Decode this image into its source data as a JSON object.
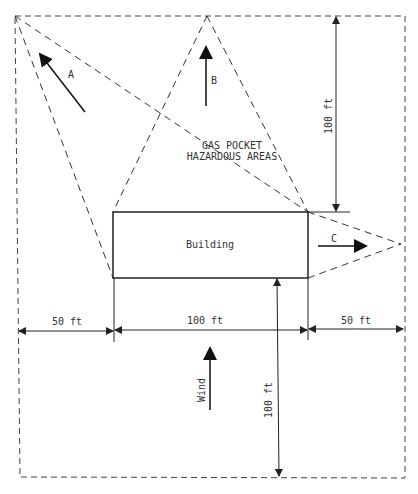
{
  "diagram": {
    "building_label": "Building",
    "hazard_label_line1": "GAS POCKET",
    "hazard_label_line2": "HAZARDOUS AREAS",
    "arrow_a_label": "A",
    "arrow_b_label": "B",
    "arrow_c_label": "C",
    "wind_label": "Wind",
    "dim_top_height": "100 ft",
    "dim_bottom_height": "100 ft",
    "dim_left_width": "50 ft",
    "dim_center_width": "100 ft",
    "dim_right_width": "50 ft",
    "line_color": "#222222"
  }
}
